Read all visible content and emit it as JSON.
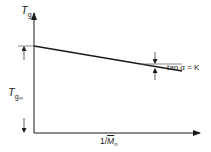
{
  "diagram": {
    "y_axis_label": {
      "main": "T",
      "sub": "g"
    },
    "intercept_label": {
      "main": "T",
      "sub": "g",
      "subsub": "∞"
    },
    "x_axis_label": {
      "prefix": "1/",
      "main": "M",
      "sub": "n"
    },
    "slope_annotation": "tan α = K",
    "colors": {
      "stroke": "#1a1a1a",
      "guide": "#555555"
    }
  }
}
